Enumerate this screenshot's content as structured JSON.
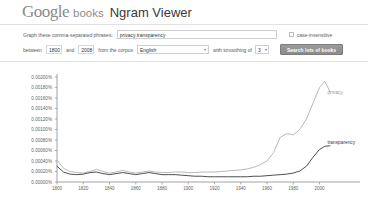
{
  "header": {
    "logo_google": "Google",
    "logo_books": "books",
    "title": "Ngram Viewer"
  },
  "form": {
    "phrases_label": "Graph these comma-separated phrases:",
    "phrases_value": "privacy,transparency",
    "phrases_placeholder": "",
    "case_insensitive_label": "case-insensitive",
    "between_label": "between",
    "year_start": "1800",
    "and_label": "and",
    "year_end": "2008",
    "corpus_label": "from the corpus",
    "corpus_value": "English",
    "smoothing_label": "with smoothing of",
    "smoothing_value": "3",
    "search_button_label": "Search lots of books",
    "caret_glyph": "▾"
  },
  "chart_data": {
    "type": "line",
    "title": "",
    "xlabel": "",
    "ylabel": "",
    "xlim": [
      1800,
      2008
    ],
    "ylim": [
      0.0,
      0.002
    ],
    "grid": false,
    "legend_position": "right-inline",
    "xticks": [
      1800,
      1820,
      1840,
      1860,
      1880,
      1900,
      1920,
      1940,
      1960,
      1980,
      2000
    ],
    "xticklabels": [
      "1800",
      "1820",
      "1840",
      "1860",
      "1880",
      "1900",
      "1920",
      "1940",
      "1960",
      "1980",
      "2000"
    ],
    "yticks": [
      0.0,
      0.0002,
      0.0004,
      0.0006,
      0.0008,
      0.001,
      0.0012,
      0.0014,
      0.0016,
      0.0018,
      0.002
    ],
    "yticklabels": [
      "0.00000%",
      "0.00020%",
      "0.00040%",
      "0.00060%",
      "0.00080%",
      "0.00100%",
      "0.00120%",
      "0.00140%",
      "0.00160%",
      "0.00180%",
      "0.00200%"
    ],
    "x": [
      1800,
      1805,
      1810,
      1815,
      1820,
      1825,
      1830,
      1835,
      1840,
      1845,
      1850,
      1855,
      1860,
      1865,
      1870,
      1875,
      1880,
      1885,
      1890,
      1895,
      1900,
      1905,
      1910,
      1915,
      1920,
      1925,
      1930,
      1935,
      1940,
      1945,
      1950,
      1955,
      1960,
      1965,
      1970,
      1975,
      1980,
      1985,
      1990,
      1995,
      2000,
      2004,
      2008
    ],
    "series": [
      {
        "name": "privacy",
        "color": "#b0b0b0",
        "label_x": 2003,
        "label_y": 0.00168,
        "values": [
          0.00042,
          0.00026,
          0.0002,
          0.00018,
          0.00017,
          0.0002,
          0.00024,
          0.0002,
          0.00017,
          0.00019,
          0.00022,
          0.00019,
          0.00017,
          0.00019,
          0.00021,
          0.00019,
          0.00018,
          0.00018,
          0.00019,
          0.00019,
          0.00018,
          0.00018,
          0.00019,
          0.00019,
          0.00019,
          0.0002,
          0.00021,
          0.00022,
          0.00023,
          0.00025,
          0.00028,
          0.00033,
          0.0004,
          0.00056,
          0.00085,
          0.00092,
          0.0009,
          0.001,
          0.0012,
          0.0015,
          0.0018,
          0.00192,
          0.00172
        ]
      },
      {
        "name": "transparency",
        "color": "#3a3a3a",
        "label_x": 2003,
        "label_y": 0.00073,
        "values": [
          0.0003,
          0.00019,
          0.00015,
          0.00014,
          0.00015,
          0.00018,
          0.00019,
          0.00016,
          0.00014,
          0.00016,
          0.00018,
          0.00016,
          0.00014,
          0.00016,
          0.00018,
          0.00016,
          0.00014,
          0.00014,
          0.00014,
          0.00013,
          0.00012,
          0.00011,
          0.00011,
          0.0001,
          0.0001,
          0.0001,
          0.0001,
          0.0001,
          0.0001,
          0.0001,
          0.00011,
          0.00011,
          0.00012,
          0.00013,
          0.00014,
          0.00015,
          0.00017,
          0.00021,
          0.0003,
          0.00047,
          0.00062,
          0.00068,
          0.00069
        ]
      }
    ]
  }
}
